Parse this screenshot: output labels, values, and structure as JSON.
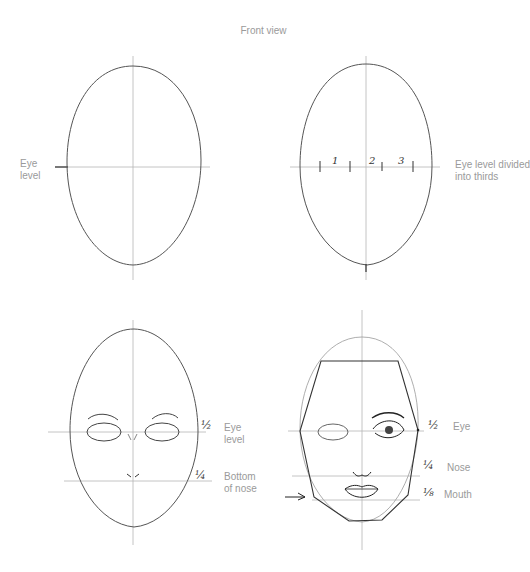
{
  "title": "Front view",
  "panels": {
    "top_left": {
      "label_line1": "Eye",
      "label_line2": "level"
    },
    "top_right": {
      "label_line1": "Eye level divided",
      "label_line2": "into thirds",
      "thirds": [
        "1",
        "2",
        "3"
      ]
    },
    "bottom_left": {
      "eye_fraction": "½",
      "eye_label_line1": "Eye",
      "eye_label_line2": "level",
      "nose_fraction": "¼",
      "nose_label_line1": "Bottom",
      "nose_label_line2": "of nose"
    },
    "bottom_right": {
      "eye_fraction": "½",
      "eye_label": "Eye",
      "nose_fraction": "¼",
      "nose_label": "Nose",
      "mouth_fraction": "⅛",
      "mouth_label": "Mouth"
    }
  },
  "colors": {
    "stroke": "#444444",
    "guide": "#b0b0b0",
    "label": "#9a9a9a"
  }
}
